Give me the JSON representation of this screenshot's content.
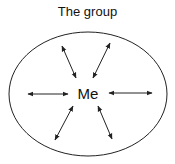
{
  "title": "The group",
  "center_label": "Me",
  "colors": {
    "stroke": "#222222",
    "background": "#ffffff"
  },
  "ellipse": {
    "cx": 88,
    "cy": 94,
    "rx": 79,
    "ry": 62
  },
  "arrows": [
    {
      "name": "upper-left",
      "x1": 62,
      "y1": 46,
      "x2": 76,
      "y2": 78
    },
    {
      "name": "upper-right",
      "x1": 110,
      "y1": 43,
      "x2": 93,
      "y2": 78
    },
    {
      "name": "left",
      "x1": 28,
      "y1": 94,
      "x2": 68,
      "y2": 94
    },
    {
      "name": "right",
      "x1": 109,
      "y1": 93,
      "x2": 152,
      "y2": 93
    },
    {
      "name": "lower-left",
      "x1": 73,
      "y1": 106,
      "x2": 55,
      "y2": 140
    },
    {
      "name": "lower-right",
      "x1": 98,
      "y1": 106,
      "x2": 112,
      "y2": 139
    }
  ]
}
